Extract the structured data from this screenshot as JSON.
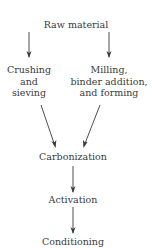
{
  "diagram": {
    "type": "process-flowchart",
    "nodes": {
      "raw_material": "Raw material",
      "crushing": {
        "line1": "Crushing",
        "line2": "and",
        "line3": "sieving"
      },
      "milling": {
        "line1": "Milling,",
        "line2": "binder addition,",
        "line3": "and forming"
      },
      "carbonization": "Carbonization",
      "activation": "Activation",
      "conditioning": "Conditioning"
    },
    "edges": [
      {
        "from": "Raw material",
        "to": "Crushing and sieving"
      },
      {
        "from": "Raw material",
        "to": "Milling, binder addition, and forming"
      },
      {
        "from": "Crushing and sieving",
        "to": "Carbonization"
      },
      {
        "from": "Milling, binder addition, and forming",
        "to": "Carbonization"
      },
      {
        "from": "Carbonization",
        "to": "Activation"
      },
      {
        "from": "Activation",
        "to": "Conditioning"
      }
    ],
    "colors": {
      "text": "#3a3a3a",
      "line": "#3a3a3a"
    }
  }
}
